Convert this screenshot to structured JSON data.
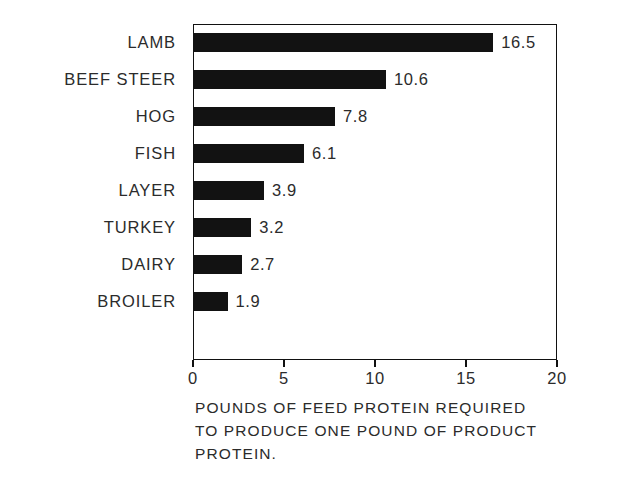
{
  "chart_data": {
    "type": "bar",
    "orientation": "horizontal",
    "title": "",
    "subtitle": "",
    "xlabel": "POUNDS OF FEED PROTEIN REQUIRED TO PRODUCE ONE POUND OF PRODUCT PROTEIN.",
    "ylabel": "",
    "categories": [
      "LAMB",
      "BEEF STEER",
      "HOG",
      "FISH",
      "LAYER",
      "TURKEY",
      "DAIRY",
      "BROILER"
    ],
    "values": [
      16.5,
      10.6,
      7.8,
      6.1,
      3.9,
      3.2,
      2.7,
      1.9
    ],
    "value_labels": [
      "16.5",
      "10.6",
      "7.8",
      "6.1",
      "3.9",
      "3.2",
      "2.7",
      "1.9"
    ],
    "xlim": [
      0,
      20
    ],
    "xticks": [
      0,
      5,
      10,
      15,
      20
    ],
    "xtick_labels": [
      "0",
      "5",
      "10",
      "15",
      "20"
    ],
    "grid": false,
    "legend": null,
    "bar_color": "#121212",
    "frame_color": "#111111",
    "background": "#ffffff"
  },
  "caption": {
    "line1": "POUNDS OF FEED PROTEIN REQUIRED",
    "line2": "TO PRODUCE ONE POUND OF PRODUCT",
    "line3": "PROTEIN."
  }
}
